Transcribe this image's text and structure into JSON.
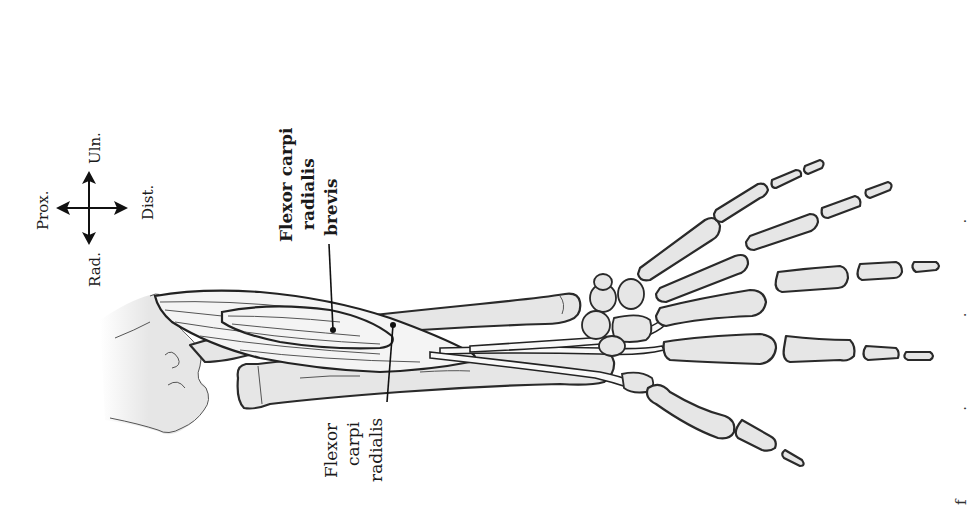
{
  "figure": {
    "type": "anatomical-illustration",
    "orientation_compass": {
      "proximal": "Prox.",
      "distal": "Dist.",
      "ulnar": "Uln.",
      "radial": "Rad."
    },
    "labels": {
      "primary": {
        "lines": [
          "Flexor carpi",
          "radialis",
          "brevis"
        ],
        "weight": "bold"
      },
      "secondary": {
        "lines": [
          "Flexor",
          "carpi",
          "radialis"
        ],
        "weight": "regular"
      }
    },
    "caption_fragment": "f . . . "
  },
  "colors": {
    "bone_fill": "#e6e6e6",
    "outline": "#2a2a2a",
    "background": "#ffffff"
  }
}
